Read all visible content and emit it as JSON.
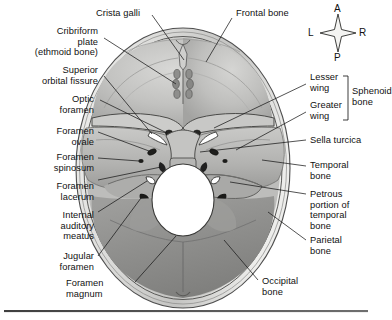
{
  "figure": {
    "background": "#ffffff",
    "rule_color": "#4a4a4a"
  },
  "orientation_compass": {
    "name": "anatomical-orientation-compass",
    "anterior": "A",
    "left": "L",
    "right": "R",
    "posterior": "P"
  },
  "bracket": {
    "label": "Sphenoid\nbone"
  },
  "labels": {
    "crista_galli": "Crista galli",
    "frontal_bone": "Frontal bone",
    "cribriform_plate": "Cribriform\nplate\n(ethmoid bone)",
    "superior_orbital_fissure": "Superior\norbital fissure",
    "optic_foramen": "Optic\nforamen",
    "foramen_ovale": "Foramen\novale",
    "foramen_spinosum": "Foramen\nspinosum",
    "foramen_lacerum": "Foramen\nlacerum",
    "internal_auditory_meatus": "Internal\nauditory\nmeatus",
    "jugular_foramen": "Jugular\nforamen",
    "foramen_magnum": "Foramen\nmagnum",
    "lesser_wing": "Lesser\nwing",
    "greater_wing": "Greater\nwing",
    "sella_turcica": "Sella turcica",
    "temporal_bone": "Temporal\nbone",
    "petrous_portion": "Petrous\nportion of\ntemporal\nbone",
    "parietal_bone": "Parietal\nbone",
    "occipital_bone": "Occipital\nbone"
  }
}
